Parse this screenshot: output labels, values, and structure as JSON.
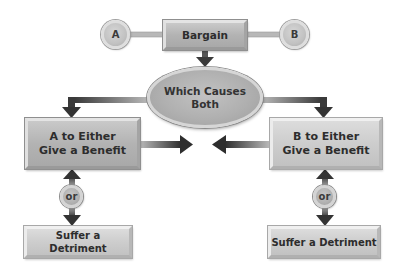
{
  "diagram": {
    "nodes": {
      "party_a": {
        "label": "A"
      },
      "party_b": {
        "label": "B"
      },
      "bargain": {
        "label": "Bargain"
      },
      "which_causes": {
        "line1": "Which Causes",
        "line2": "Both"
      },
      "a_benefit": {
        "line1": "A to Either",
        "line2": "Give a Benefit"
      },
      "b_benefit": {
        "line1": "B to Either",
        "line2": "Give a Benefit"
      },
      "or_left": {
        "label": "or"
      },
      "or_right": {
        "label": "or"
      },
      "a_detriment": {
        "label": "Suffer a Detriment"
      },
      "b_detriment": {
        "label": "Suffer a Detriment"
      }
    },
    "edges": [
      {
        "from": "party_a",
        "to": "bargain",
        "type": "line"
      },
      {
        "from": "bargain",
        "to": "party_b",
        "type": "line"
      },
      {
        "from": "bargain",
        "to": "which_causes",
        "type": "arrow"
      },
      {
        "from": "which_causes",
        "to": "a_benefit",
        "type": "arrow"
      },
      {
        "from": "which_causes",
        "to": "b_benefit",
        "type": "arrow"
      },
      {
        "from": "a_benefit",
        "to": "center",
        "type": "arrow"
      },
      {
        "from": "b_benefit",
        "to": "center",
        "type": "arrow"
      },
      {
        "from": "or_left",
        "to": "a_benefit",
        "type": "arrow"
      },
      {
        "from": "or_left",
        "to": "a_detriment",
        "type": "arrow"
      },
      {
        "from": "or_right",
        "to": "b_benefit",
        "type": "arrow"
      },
      {
        "from": "or_right",
        "to": "b_detriment",
        "type": "arrow"
      }
    ],
    "colors": {
      "box_fill": "#b8b8b8",
      "arrow": "#3a3a3a",
      "text": "#2d2d2d",
      "background": "#ffffff"
    }
  }
}
